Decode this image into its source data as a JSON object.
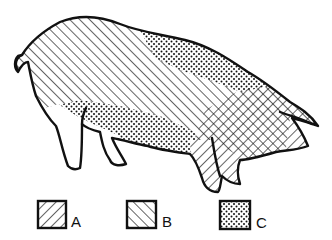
{
  "colors": {
    "ink": "#111111",
    "background": "#ffffff"
  },
  "legend": {
    "items": [
      {
        "key": "A",
        "pattern": "diagonal-hatch-forward",
        "label": "A"
      },
      {
        "key": "B",
        "pattern": "diagonal-hatch-back",
        "label": "B"
      },
      {
        "key": "C",
        "pattern": "dot-stipple",
        "label": "C"
      }
    ]
  },
  "regions": [
    {
      "name": "back-and-rump",
      "pattern": "B"
    },
    {
      "name": "shoulder-top",
      "pattern": "C"
    },
    {
      "name": "belly",
      "pattern": "C"
    },
    {
      "name": "head-and-neck",
      "pattern": "A+B crosshatch"
    },
    {
      "name": "front-legs",
      "pattern": "A"
    },
    {
      "name": "snout",
      "pattern": "A"
    },
    {
      "name": "hind-legs",
      "pattern": "none"
    }
  ]
}
